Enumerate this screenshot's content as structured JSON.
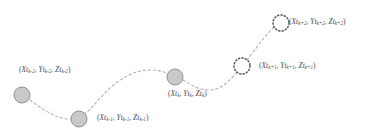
{
  "figure": {
    "type": "trajectory-diagram",
    "background_color": "#ffffff",
    "path_color": "#b0b0b0",
    "path_style": "dashed",
    "observed_fill": "#c9c9c9",
    "observed_stroke": "#8a8a8a",
    "predicted_fill": "none",
    "predicted_stroke": "#555555",
    "label_color": "#4a4a4a"
  },
  "chart_data": {
    "type": "scatter",
    "title": "",
    "xlabel": "",
    "ylabel": "",
    "grid": false,
    "legend": "none",
    "xlim": [
      0,
      368
    ],
    "ylim": [
      134,
      0
    ],
    "series": [
      {
        "name": "observed-positions",
        "marker": "filled-circle",
        "points": [
          {
            "id": "t_k_minus_2",
            "x": 22,
            "y": 95,
            "r": 8.0
          },
          {
            "id": "t_k_minus_1",
            "x": 79,
            "y": 119,
            "r": 8.0
          },
          {
            "id": "t_k",
            "x": 175,
            "y": 77,
            "r": 8.0
          }
        ]
      },
      {
        "name": "predicted-positions",
        "marker": "dotted-circle",
        "points": [
          {
            "id": "t_k_plus_1",
            "x": 242,
            "y": 66,
            "r": 8.0
          },
          {
            "id": "t_k_plus_2",
            "x": 281,
            "y": 23,
            "r": 8.0
          }
        ]
      }
    ]
  },
  "nodes": [
    {
      "key": "t_k_minus_2",
      "kind": "observed",
      "cx": 22,
      "cy": 95,
      "r": 8.0,
      "label": {
        "x": 19,
        "y": 66,
        "open": "(",
        "x_var": "X",
        "x_time": "t",
        "x_sub": "k-2",
        "sep1": ", ",
        "y_var": "Y",
        "y_time": "t",
        "y_sub": "k-2",
        "sep2": ", ",
        "z_var": "Z",
        "z_time": "t",
        "z_sub": "k-2",
        "close": ")"
      }
    },
    {
      "key": "t_k_minus_1",
      "kind": "observed",
      "cx": 79,
      "cy": 119,
      "r": 8.0,
      "label": {
        "x": 97,
        "y": 114,
        "open": "(",
        "x_var": "X",
        "x_time": "t",
        "x_sub": "k-1",
        "sep1": ", ",
        "y_var": "Y",
        "y_time": "t",
        "y_sub": "k-1",
        "sep2": ", ",
        "z_var": "Z",
        "z_time": "t",
        "z_sub": "k-1",
        "close": ")"
      }
    },
    {
      "key": "t_k",
      "kind": "observed",
      "cx": 175,
      "cy": 77,
      "r": 8.0,
      "label": {
        "x": 168,
        "y": 90,
        "open": "(",
        "x_var": "X",
        "x_time": "t",
        "x_sub": "k",
        "sep1": ", ",
        "y_var": "Y",
        "y_time": "t",
        "y_sub": "k",
        "sep2": ", ",
        "z_var": "Z",
        "z_time": "t",
        "z_sub": "k",
        "close": ")"
      }
    },
    {
      "key": "t_k_plus_1",
      "kind": "predicted",
      "cx": 242,
      "cy": 66,
      "r": 8.0,
      "label": {
        "x": 259,
        "y": 62,
        "open": "(",
        "x_var": "X",
        "x_time": "t",
        "x_sub": "k+1",
        "sep1": ", ",
        "y_var": "Y",
        "y_time": "t",
        "y_sub": "k+1",
        "sep2": ", ",
        "z_var": "Z",
        "z_time": "t",
        "z_sub": "k+1",
        "close": ")"
      }
    },
    {
      "key": "t_k_plus_2",
      "kind": "predicted",
      "cx": 281,
      "cy": 23,
      "r": 8.0,
      "label": {
        "x": 289,
        "y": 18,
        "open": "(",
        "x_var": "X",
        "x_time": "t",
        "x_sub": "k+2",
        "sep1": ", ",
        "y_var": "Y",
        "y_time": "t",
        "y_sub": "k+2",
        "sep2": ", ",
        "z_var": "Z",
        "z_time": "t",
        "z_sub": "k+2",
        "close": ")"
      }
    }
  ],
  "path": {
    "name": "trajectory-curve",
    "d": "M 30 100 C 46 112, 60 120, 71 119 C 86 118, 92 106, 104 94 C 118 79, 134 70, 150 70 C 161 70, 168 73, 172 76 M 183 80 C 191 85, 199 90, 209 90 C 222 90, 230 80, 237 72 M 247 60 C 255 50, 263 38, 271 30 C 273 28, 275 26, 277 25"
  }
}
